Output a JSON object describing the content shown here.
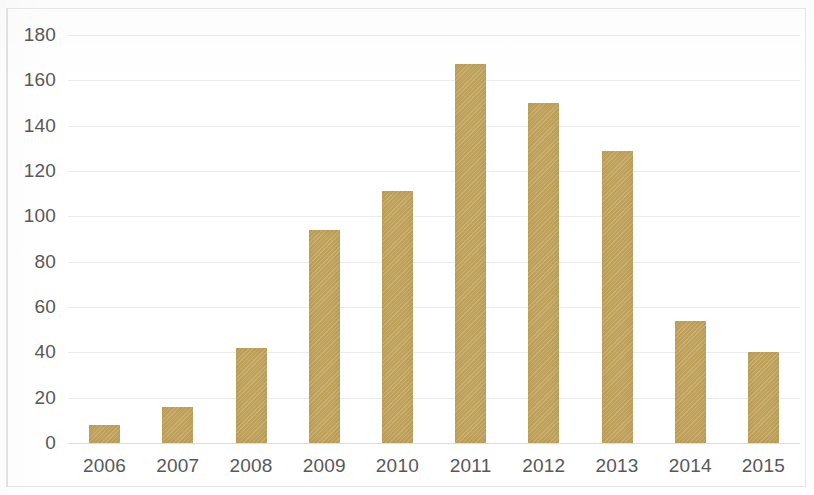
{
  "chart_data": {
    "type": "bar",
    "title": "",
    "xlabel": "",
    "ylabel": "",
    "categories": [
      "2006",
      "2007",
      "2008",
      "2009",
      "2010",
      "2011",
      "2012",
      "2013",
      "2014",
      "2015"
    ],
    "values": [
      8,
      16,
      42,
      94,
      111,
      167,
      150,
      129,
      54,
      40
    ],
    "series": [
      {
        "name": "",
        "values": [
          8,
          16,
          42,
          94,
          111,
          167,
          150,
          129,
          54,
          40
        ]
      }
    ],
    "ylim": [
      0,
      180
    ],
    "ytick_step": 20,
    "ytick_labels": [
      "0",
      "20",
      "40",
      "60",
      "80",
      "100",
      "120",
      "140",
      "160",
      "180"
    ],
    "xtick_labels": [
      "2006",
      "2007",
      "2008",
      "2009",
      "2010",
      "2011",
      "2012",
      "2013",
      "2014",
      "2015"
    ],
    "grid": true,
    "grid_axis": "y",
    "legend": false,
    "legend_position": "none",
    "bar_color": "#c5a75f",
    "grid_color": "#ebebee",
    "axis_text_color": "#585858",
    "background_color": "#ffffff"
  }
}
